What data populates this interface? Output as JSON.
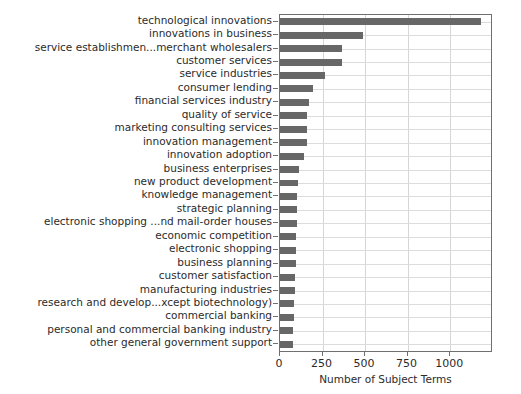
{
  "chart_data": {
    "type": "bar",
    "orientation": "horizontal",
    "title": "",
    "xlabel": "Number of Subject Terms",
    "ylabel": "",
    "xlim": [
      0,
      1240
    ],
    "xticks": [
      0,
      250,
      500,
      750,
      1000
    ],
    "xticklabels": [
      "0",
      "250",
      "500",
      "750",
      "1000"
    ],
    "grid": true,
    "grid_axis": "both",
    "bar_color": "#676767",
    "categories": [
      "technological innovations",
      "innovations in business",
      "service establishmen...merchant wholesalers",
      "customer services",
      "service industries",
      "consumer lending",
      "financial services industry",
      "quality of service",
      "marketing consulting services",
      "innovation management",
      "innovation adoption",
      "business enterprises",
      "new product development",
      "knowledge management",
      "strategic planning",
      "electronic shopping ...nd mail-order houses",
      "economic competition",
      "electronic shopping",
      "business planning",
      "customer satisfaction",
      "manufacturing industries",
      "research and develop...xcept biotechnology)",
      "commercial banking",
      "personal and commercial banking industry",
      "other general government support"
    ],
    "values": [
      1180,
      490,
      365,
      362,
      263,
      192,
      170,
      160,
      160,
      158,
      140,
      110,
      105,
      102,
      100,
      98,
      96,
      95,
      92,
      90,
      88,
      85,
      80,
      78,
      75
    ]
  },
  "xaxis": {
    "title": "Number of Subject Terms"
  }
}
